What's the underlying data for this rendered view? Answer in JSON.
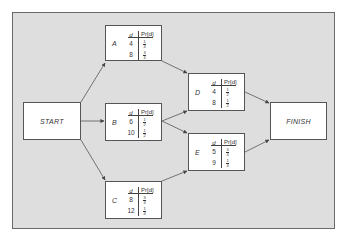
{
  "diagram": {
    "type": "activity-network",
    "background_color": "#dedede",
    "node_color": "#ffffff",
    "start_label": "START",
    "finish_label": "FINISH",
    "table_header": {
      "d": "d",
      "pr": "Pr[d]"
    },
    "activities": [
      {
        "id": "A",
        "label": "A",
        "rows": [
          {
            "d": "4",
            "num": "1",
            "den": "4"
          },
          {
            "d": "8",
            "num": "3",
            "den": "4"
          }
        ]
      },
      {
        "id": "B",
        "label": "B",
        "rows": [
          {
            "d": "6",
            "num": "1",
            "den": "2"
          },
          {
            "d": "10",
            "num": "1",
            "den": "2"
          }
        ]
      },
      {
        "id": "C",
        "label": "C",
        "rows": [
          {
            "d": "8",
            "num": "3",
            "den": "4"
          },
          {
            "d": "12",
            "num": "1",
            "den": "4"
          }
        ]
      },
      {
        "id": "D",
        "label": "D",
        "rows": [
          {
            "d": "4",
            "num": "1",
            "den": "2"
          },
          {
            "d": "8",
            "num": "1",
            "den": "2"
          }
        ]
      },
      {
        "id": "E",
        "label": "E",
        "rows": [
          {
            "d": "5",
            "num": "3",
            "den": "4"
          },
          {
            "d": "9",
            "num": "1",
            "den": "4"
          }
        ]
      }
    ],
    "edges": [
      [
        "START",
        "A"
      ],
      [
        "START",
        "B"
      ],
      [
        "START",
        "C"
      ],
      [
        "A",
        "D"
      ],
      [
        "B",
        "D"
      ],
      [
        "B",
        "E"
      ],
      [
        "C",
        "E"
      ],
      [
        "D",
        "FINISH"
      ],
      [
        "E",
        "FINISH"
      ]
    ]
  }
}
